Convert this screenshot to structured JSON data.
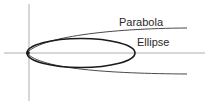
{
  "diagram": {
    "labels": {
      "parabola": "Parabola",
      "ellipse": "Ellipse"
    },
    "colors": {
      "background": "#ffffff",
      "axis": "#9a9a9a",
      "parabola": "#4a4a4a",
      "ellipse": "#1a1a1a",
      "text": "#2a2a2a"
    },
    "geometry": {
      "vertex": [
        27,
        53
      ],
      "y_axis_x": 29,
      "x_axis_y": 53,
      "ellipse_center": [
        81,
        53
      ],
      "ellipse_semi_axes": [
        54,
        14
      ],
      "parabola_end_upper": [
        187,
        28
      ],
      "parabola_end_lower": [
        187,
        74
      ]
    }
  }
}
